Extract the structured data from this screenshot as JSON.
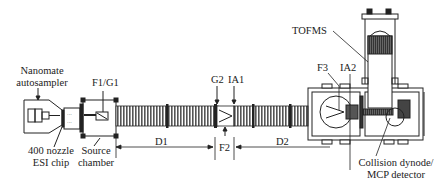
{
  "diagram": {
    "labels": {
      "nanomate_line1": "Nanomate",
      "nanomate_line2": "autosampler",
      "esi_line1": "400 nozzle",
      "esi_line2": "ESI chip",
      "source_line1": "Source",
      "source_line2": "chamber",
      "f1g1": "F1/G1",
      "g2": "G2",
      "ia1": "IA1",
      "f2": "F2",
      "d1": "D1",
      "d2": "D2",
      "f3": "F3",
      "ia2": "IA2",
      "tofms": "TOFMS",
      "detector_line1": "Collision dynode/",
      "detector_line2": "MCP detector"
    },
    "colors": {
      "ink": "#222222",
      "background": "#ffffff",
      "tube_fill": "#777777"
    }
  }
}
